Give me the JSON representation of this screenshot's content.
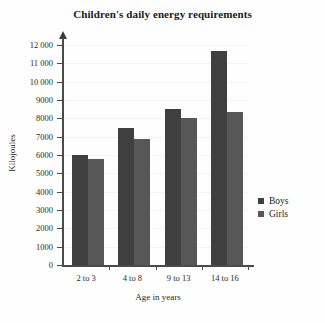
{
  "chart_data": {
    "type": "bar",
    "title": "Children's daily energy requirements",
    "xlabel": "Age in years",
    "ylabel": "Kilojoules",
    "categories": [
      "2 to 3",
      "4 to 8",
      "9 to 13",
      "14 to 16"
    ],
    "series": [
      {
        "name": "Boys",
        "values": [
          6000,
          7500,
          8500,
          11700
        ],
        "color": "#3f3f3f"
      },
      {
        "name": "Girls",
        "values": [
          5800,
          6850,
          8000,
          8350
        ],
        "color": "#575757"
      }
    ],
    "ylim": [
      0,
      12000
    ],
    "ytick_step": 1000,
    "ytick_labels": [
      "12 000",
      "11 000",
      "10 000",
      "9000",
      "8000",
      "7000",
      "6000",
      "5000",
      "4000",
      "3000",
      "2000",
      "1000",
      "0"
    ],
    "grid": true,
    "legend_position": "right"
  },
  "legend": {
    "items": [
      {
        "label": "Boys"
      },
      {
        "label": "Girls"
      }
    ]
  }
}
